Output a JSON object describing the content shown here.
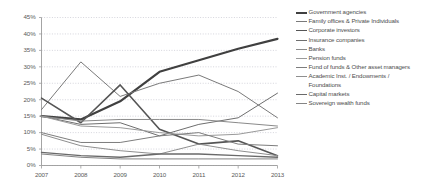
{
  "chart_data": {
    "type": "line",
    "title": "",
    "xlabel": "",
    "ylabel": "",
    "x": [
      2007,
      2008,
      2009,
      2010,
      2011,
      2012,
      2013
    ],
    "xtick_labels": [
      "2007",
      "2008",
      "2009",
      "2010",
      "2011",
      "2012",
      "2013"
    ],
    "ytick_labels": [
      "0%",
      "5%",
      "10%",
      "15%",
      "20%",
      "25%",
      "30%",
      "35%",
      "40%",
      "45%"
    ],
    "ytick_values": [
      0,
      5,
      10,
      15,
      20,
      25,
      30,
      35,
      40,
      45
    ],
    "ylim": [
      0,
      45
    ],
    "grid": true,
    "legend_position": "right",
    "series": [
      {
        "name": "Government agencies",
        "color": "#404040",
        "width": 2.2,
        "values": [
          15.0,
          14.0,
          19.5,
          28.5,
          32.0,
          35.5,
          38.5
        ]
      },
      {
        "name": "Family offices & Private Individuals",
        "color": "#7a7a7a",
        "width": 1.0,
        "values": [
          17.0,
          31.5,
          21.0,
          25.0,
          27.5,
          22.5,
          14.5
        ]
      },
      {
        "name": "Corporate investors",
        "color": "#555555",
        "width": 1.6,
        "values": [
          20.5,
          13.0,
          24.5,
          11.0,
          6.5,
          7.5,
          3.0
        ]
      },
      {
        "name": "Insurance companies",
        "color": "#6e6e6e",
        "width": 1.0,
        "values": [
          15.0,
          12.5,
          13.0,
          9.0,
          12.5,
          14.5,
          22.0
        ]
      },
      {
        "name": "Banks",
        "color": "#8a8a8a",
        "width": 1.0,
        "values": [
          15.0,
          13.5,
          14.0,
          14.0,
          14.0,
          13.0,
          12.0
        ]
      },
      {
        "name": "Pension funds",
        "color": "#9a9a9a",
        "width": 1.0,
        "values": [
          15.0,
          12.0,
          11.5,
          10.0,
          9.0,
          9.5,
          11.5
        ]
      },
      {
        "name": "Fund of funds & Other asset managers",
        "color": "#7d7d7d",
        "width": 1.0,
        "values": [
          10.0,
          7.0,
          7.0,
          9.0,
          10.0,
          6.5,
          6.0
        ]
      },
      {
        "name": "Academic Inst. / Endowments / Foundations",
        "color": "#8f8f8f",
        "width": 1.0,
        "values": [
          9.5,
          6.0,
          4.5,
          3.5,
          6.5,
          4.5,
          3.0
        ]
      },
      {
        "name": "Capital markets",
        "color": "#6a6a6a",
        "width": 1.4,
        "values": [
          4.0,
          3.0,
          2.5,
          3.5,
          3.5,
          3.0,
          2.5
        ]
      },
      {
        "name": "Sovereign wealth funds",
        "color": "#858585",
        "width": 1.0,
        "values": [
          3.5,
          2.5,
          2.0,
          2.0,
          2.0,
          2.0,
          2.0
        ]
      }
    ]
  },
  "legend": {
    "items": [
      {
        "label": "Government agencies"
      },
      {
        "label": "Family offices & Private Individuals"
      },
      {
        "label": "Corporate investors"
      },
      {
        "label": "Insurance companies"
      },
      {
        "label": "Banks"
      },
      {
        "label": "Pension funds"
      },
      {
        "label": "Fund of funds & Other asset managers"
      },
      {
        "label": "Academic Inst. / Endowments / Foundations"
      },
      {
        "label": "Capital markets"
      },
      {
        "label": "Sovereign wealth funds"
      }
    ]
  }
}
